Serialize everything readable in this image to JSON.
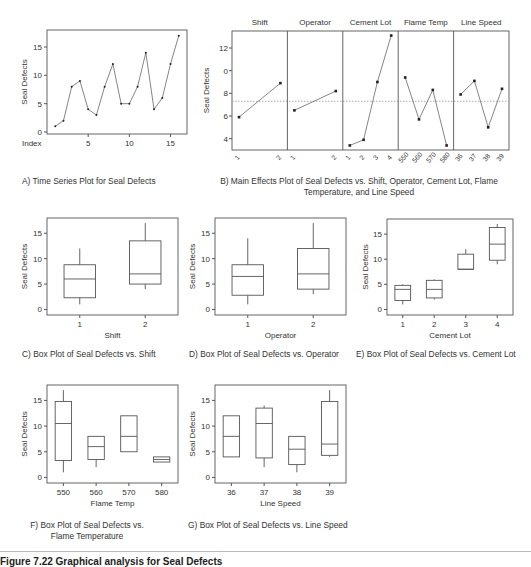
{
  "figure_caption": "Figure 7.22 Graphical analysis for Seal Defects",
  "captions": {
    "a": "A) Time Series Plot for Seal Defects",
    "b": "B) Main Effects Plot of Seal Defects vs. Shift, Operator, Cement Lot, Flame Temperature, and Line Speed",
    "c": "C) Box Plot of Seal Defects vs. Shift",
    "d": "D) Box Plot of Seal Defects vs. Operator",
    "e": "E) Box Plot of Seal Defects vs. Cement Lot",
    "f": "F) Box Plot of Seal Defects vs. Flame Temperature",
    "g": "G) Box Plot of Seal Defects vs. Line Speed"
  },
  "chart_data": [
    {
      "id": "a",
      "type": "line",
      "title": "Time Series Plot for Seal Defects",
      "xlabel": "Index",
      "ylabel": "Seal Defects",
      "x": [
        1,
        2,
        3,
        4,
        5,
        6,
        7,
        8,
        9,
        10,
        11,
        12,
        13,
        14,
        15,
        16
      ],
      "values": [
        1,
        2,
        8,
        9,
        4,
        3,
        8,
        12,
        5,
        5,
        8,
        14,
        4,
        6,
        12,
        17
      ],
      "xticks": [
        5,
        10,
        15
      ],
      "yticks": [
        0,
        5,
        10,
        15
      ],
      "ylim": [
        0,
        18
      ],
      "xlim": [
        0,
        17
      ]
    },
    {
      "id": "b",
      "type": "line",
      "title": "Main Effects Plot of Seal Defects",
      "ylabel": "Seal Defects",
      "ylim": [
        3,
        13.5
      ],
      "yticks": [
        4,
        6,
        8,
        12
      ],
      "ytick_labels": [
        "4",
        "6",
        "8",
        "0",
        "12"
      ],
      "mean_line": 7.3,
      "panels": [
        {
          "name": "Shift",
          "categories": [
            "1",
            "2"
          ],
          "values": [
            5.9,
            8.9
          ]
        },
        {
          "name": "Operator",
          "categories": [
            "1",
            "2"
          ],
          "values": [
            6.5,
            8.2
          ]
        },
        {
          "name": "Cement Lot",
          "categories": [
            "1",
            "2",
            "3",
            "4"
          ],
          "values": [
            3.4,
            3.9,
            9.0,
            13.1
          ]
        },
        {
          "name": "Flame Temp",
          "categories": [
            "550",
            "560",
            "570",
            "580"
          ],
          "values": [
            9.4,
            5.7,
            8.3,
            3.4
          ]
        },
        {
          "name": "Line Speed",
          "categories": [
            "36",
            "37",
            "38",
            "39"
          ],
          "values": [
            7.9,
            9.1,
            5.0,
            8.4
          ]
        }
      ]
    },
    {
      "id": "c",
      "type": "box",
      "xlabel": "Shift",
      "ylabel": "Seal Defects",
      "ylim": [
        -0.5,
        18
      ],
      "yticks": [
        0,
        5,
        10,
        15
      ],
      "categories": [
        "1",
        "2"
      ],
      "boxes": [
        {
          "min": 1,
          "q1": 2.3,
          "median": 6,
          "q3": 8.8,
          "max": 12
        },
        {
          "min": 4,
          "q1": 5,
          "median": 7,
          "q3": 13.5,
          "max": 17
        }
      ]
    },
    {
      "id": "d",
      "type": "box",
      "xlabel": "Operator",
      "ylabel": "Seal Defects",
      "ylim": [
        -0.5,
        18
      ],
      "yticks": [
        0,
        5,
        10,
        15
      ],
      "categories": [
        "1",
        "2"
      ],
      "boxes": [
        {
          "min": 1,
          "q1": 2.8,
          "median": 6.5,
          "q3": 8.8,
          "max": 14
        },
        {
          "min": 3,
          "q1": 4,
          "median": 7,
          "q3": 12,
          "max": 17
        }
      ]
    },
    {
      "id": "e",
      "type": "box",
      "xlabel": "Cement Lot",
      "ylabel": "Seal Defects",
      "ylim": [
        -0.5,
        18
      ],
      "yticks": [
        0,
        5,
        10,
        15
      ],
      "categories": [
        "1",
        "2",
        "3",
        "4"
      ],
      "boxes": [
        {
          "min": 1,
          "q1": 1.8,
          "median": 4,
          "q3": 4.8,
          "max": 5
        },
        {
          "min": 2,
          "q1": 2.3,
          "median": 4,
          "q3": 5.8,
          "max": 6
        },
        {
          "min": 8,
          "q1": 8,
          "median": 8,
          "q3": 11,
          "max": 12
        },
        {
          "min": 9,
          "q1": 9.8,
          "median": 13,
          "q3": 16.3,
          "max": 17
        }
      ]
    },
    {
      "id": "f",
      "type": "box",
      "xlabel": "Flame Temp",
      "ylabel": "Seal Defects",
      "ylim": [
        -0.5,
        18
      ],
      "yticks": [
        0,
        5,
        10,
        15
      ],
      "categories": [
        "550",
        "560",
        "570",
        "580"
      ],
      "boxes": [
        {
          "min": 1,
          "q1": 3.3,
          "median": 10.5,
          "q3": 14.8,
          "max": 17
        },
        {
          "min": 2,
          "q1": 3.5,
          "median": 6,
          "q3": 8,
          "max": 8
        },
        {
          "min": 5,
          "q1": 5,
          "median": 8,
          "q3": 12,
          "max": 12
        },
        {
          "min": 3,
          "q1": 3,
          "median": 3.5,
          "q3": 4,
          "max": 4
        }
      ]
    },
    {
      "id": "g",
      "type": "box",
      "xlabel": "Line Speed",
      "ylabel": "Seal Defects",
      "ylim": [
        -0.5,
        18
      ],
      "yticks": [
        0,
        5,
        10,
        15
      ],
      "categories": [
        "36",
        "37",
        "38",
        "39"
      ],
      "boxes": [
        {
          "min": 4,
          "q1": 4,
          "median": 8,
          "q3": 12,
          "max": 12
        },
        {
          "min": 2,
          "q1": 3.8,
          "median": 10.5,
          "q3": 13.5,
          "max": 14
        },
        {
          "min": 1,
          "q1": 2.5,
          "median": 5.5,
          "q3": 8,
          "max": 8
        },
        {
          "min": 4,
          "q1": 4.3,
          "median": 6.5,
          "q3": 14.8,
          "max": 17
        }
      ]
    }
  ]
}
